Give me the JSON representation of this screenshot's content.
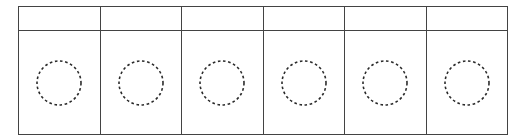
{
  "page": {
    "background_color": "#ffffff",
    "width": 526,
    "height": 140
  },
  "worksheet": {
    "name": "dashed-circle-worksheet",
    "border_color": "#434343",
    "border_width_px": 1.4,
    "column_count": 6,
    "row_count": 2,
    "columns": [
      {
        "index": 1,
        "label": ""
      },
      {
        "index": 2,
        "label": ""
      },
      {
        "index": 3,
        "label": ""
      },
      {
        "index": 4,
        "label": ""
      },
      {
        "index": 5,
        "label": ""
      },
      {
        "index": 6,
        "label": ""
      }
    ],
    "header_row": {
      "name": "header-row",
      "height_px": 23,
      "cells": [
        "",
        "",
        "",
        "",
        "",
        ""
      ]
    },
    "body_row": {
      "name": "body-row",
      "height_px": 103,
      "cells": [
        {
          "index": 1,
          "label": "",
          "shape": "dashed-circle"
        },
        {
          "index": 2,
          "label": "",
          "shape": "dashed-circle"
        },
        {
          "index": 3,
          "label": "",
          "shape": "dashed-circle"
        },
        {
          "index": 4,
          "label": "",
          "shape": "dashed-circle"
        },
        {
          "index": 5,
          "label": "",
          "shape": "dashed-circle"
        },
        {
          "index": 6,
          "label": "",
          "shape": "dashed-circle"
        }
      ]
    },
    "circle": {
      "name": "dashed-circle-icon",
      "diameter_px": 46,
      "stroke_color": "#2b2b2b",
      "stroke_width_px": 1.6,
      "dash_pattern": "2.6 2.6",
      "fill": "none"
    }
  }
}
